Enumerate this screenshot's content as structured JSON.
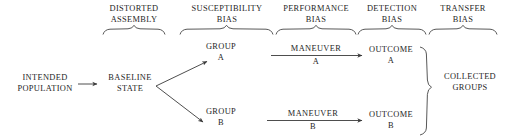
{
  "diagram": {
    "stroke_color": "#3a3a3a",
    "text_color": "#262626",
    "background": "#ffffff",
    "headers": [
      {
        "id": "distorted-assembly",
        "label": "DISTORTED\nASSEMBLY"
      },
      {
        "id": "susceptibility-bias",
        "label": "SUSCEPTIBILITY\nBIAS"
      },
      {
        "id": "performance-bias",
        "label": "PERFORMANCE\nBIAS"
      },
      {
        "id": "detection-bias",
        "label": "DETECTION\nBIAS"
      },
      {
        "id": "transfer-bias",
        "label": "TRANSFER\nBIAS"
      }
    ],
    "nodes": [
      {
        "id": "intended-population",
        "label": "INTENDED\nPOPULATION"
      },
      {
        "id": "baseline-state",
        "label": "BASELINE\nSTATE"
      },
      {
        "id": "group-a",
        "label": "GROUP\nA"
      },
      {
        "id": "group-b",
        "label": "GROUP\nB"
      },
      {
        "id": "outcome-a",
        "label": "OUTCOME\nA"
      },
      {
        "id": "outcome-b",
        "label": "OUTCOME\nB"
      },
      {
        "id": "collected-groups",
        "label": "COLLECTED\nGROUPS"
      }
    ],
    "edge_labels": [
      {
        "id": "maneuver-a",
        "label": "MANEUVER"
      },
      {
        "id": "maneuver-a-sub",
        "label": "A"
      },
      {
        "id": "maneuver-b",
        "label": "MANEUVER"
      },
      {
        "id": "maneuver-b-sub",
        "label": "B"
      }
    ]
  }
}
